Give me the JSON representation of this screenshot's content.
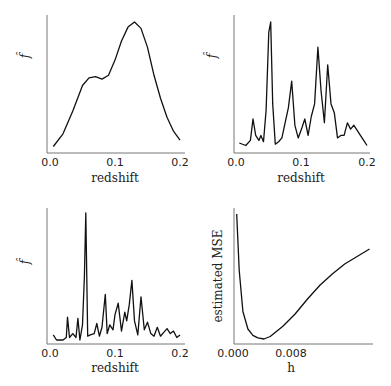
{
  "chart_data": [
    {
      "type": "line",
      "panel": "top-left",
      "title": "",
      "xlabel": "redshift",
      "ylabel": "f̂",
      "xticks": [
        "0.0",
        "0.1",
        "0.2"
      ],
      "xlim": [
        0.0,
        0.2
      ],
      "x": [
        0.005,
        0.02,
        0.035,
        0.05,
        0.06,
        0.07,
        0.08,
        0.09,
        0.1,
        0.11,
        0.12,
        0.13,
        0.14,
        0.15,
        0.16,
        0.17,
        0.18,
        0.19,
        0.2
      ],
      "y": [
        0.02,
        0.12,
        0.3,
        0.5,
        0.56,
        0.57,
        0.55,
        0.58,
        0.7,
        0.85,
        0.96,
        1.0,
        0.95,
        0.8,
        0.58,
        0.4,
        0.25,
        0.14,
        0.07
      ]
    },
    {
      "type": "line",
      "panel": "top-right",
      "title": "",
      "xlabel": "redshift",
      "ylabel": "f̂",
      "xticks": [
        "0.0",
        "0.1",
        "0.2"
      ],
      "xlim": [
        0.0,
        0.2
      ],
      "x": [
        0.005,
        0.015,
        0.022,
        0.026,
        0.03,
        0.035,
        0.038,
        0.042,
        0.046,
        0.05,
        0.053,
        0.056,
        0.06,
        0.065,
        0.07,
        0.075,
        0.08,
        0.085,
        0.09,
        0.095,
        0.1,
        0.105,
        0.11,
        0.115,
        0.12,
        0.125,
        0.13,
        0.135,
        0.14,
        0.145,
        0.15,
        0.155,
        0.16,
        0.165,
        0.17,
        0.175,
        0.18,
        0.185,
        0.19,
        0.195,
        0.2
      ],
      "y": [
        0.04,
        0.02,
        0.06,
        0.23,
        0.1,
        0.06,
        0.1,
        0.05,
        0.3,
        0.92,
        1.0,
        0.35,
        0.03,
        0.05,
        0.08,
        0.2,
        0.32,
        0.53,
        0.18,
        0.08,
        0.15,
        0.23,
        0.1,
        0.25,
        0.35,
        0.8,
        0.45,
        0.2,
        0.66,
        0.35,
        0.28,
        0.08,
        0.1,
        0.1,
        0.2,
        0.15,
        0.18,
        0.14,
        0.1,
        0.06,
        0.02
      ]
    },
    {
      "type": "line",
      "panel": "bottom-left",
      "title": "",
      "xlabel": "redshift",
      "ylabel": "f̂",
      "xticks": [
        "0.0",
        "0.1",
        "0.2"
      ],
      "xlim": [
        0.0,
        0.2
      ],
      "x": [
        0.005,
        0.01,
        0.02,
        0.025,
        0.027,
        0.03,
        0.035,
        0.04,
        0.043,
        0.046,
        0.05,
        0.053,
        0.055,
        0.058,
        0.062,
        0.068,
        0.072,
        0.076,
        0.08,
        0.085,
        0.088,
        0.092,
        0.097,
        0.1,
        0.105,
        0.11,
        0.115,
        0.118,
        0.122,
        0.126,
        0.13,
        0.135,
        0.14,
        0.145,
        0.15,
        0.155,
        0.16,
        0.165,
        0.17,
        0.175,
        0.18,
        0.185,
        0.19,
        0.195,
        0.2
      ],
      "y": [
        0.04,
        0.0,
        0.0,
        0.02,
        0.18,
        0.02,
        0.05,
        0.02,
        0.17,
        0.0,
        0.12,
        0.5,
        1.0,
        0.03,
        0.04,
        0.05,
        0.13,
        0.03,
        0.1,
        0.36,
        0.05,
        0.12,
        0.08,
        0.2,
        0.29,
        0.07,
        0.22,
        0.15,
        0.28,
        0.47,
        0.15,
        0.04,
        0.34,
        0.08,
        0.14,
        0.05,
        0.03,
        0.1,
        0.03,
        0.06,
        0.09,
        0.05,
        0.07,
        0.02,
        0.04
      ]
    },
    {
      "type": "line",
      "panel": "bottom-right",
      "title": "",
      "xlabel": "h",
      "ylabel": "estimated MSE",
      "xticks": [
        "0.000",
        "0.008"
      ],
      "xlim": [
        0.0,
        0.0112
      ],
      "x": [
        0.0003,
        0.0005,
        0.0008,
        0.0012,
        0.0016,
        0.002,
        0.0025,
        0.003,
        0.004,
        0.005,
        0.006,
        0.007,
        0.008,
        0.009,
        0.01,
        0.011
      ],
      "y": [
        1.0,
        0.55,
        0.22,
        0.08,
        0.03,
        0.01,
        0.0,
        0.02,
        0.1,
        0.2,
        0.32,
        0.43,
        0.52,
        0.6,
        0.66,
        0.72
      ]
    }
  ]
}
